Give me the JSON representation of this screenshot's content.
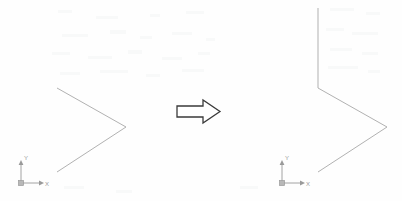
{
  "document": {
    "title": "CAD Line Drawing Exercise",
    "background_color": "#fefefe",
    "line_color": "#a8a8a8",
    "arrow_color": "#3a3a3a",
    "ucs_color": "#9a9a9a",
    "width": 402,
    "height": 201
  },
  "figures": [
    {
      "id": "before",
      "name": "Before - open chevron",
      "caption": "",
      "polyline": [
        {
          "x": 57,
          "y": 88
        },
        {
          "x": 126,
          "y": 127
        },
        {
          "x": 57,
          "y": 172
        }
      ],
      "ucs_icon": {
        "origin": {
          "x": 21,
          "y": 183
        },
        "x_label": "X",
        "y_label": "Y",
        "x_tip": {
          "x": 42,
          "y": 183
        },
        "y_tip": {
          "x": 21,
          "y": 162
        }
      }
    },
    {
      "id": "after",
      "name": "After - chevron with vertical extension",
      "caption": "",
      "polyline": [
        {
          "x": 318,
          "y": 8
        },
        {
          "x": 318,
          "y": 88
        },
        {
          "x": 387,
          "y": 127
        },
        {
          "x": 318,
          "y": 172
        }
      ],
      "ucs_icon": {
        "origin": {
          "x": 282,
          "y": 183
        },
        "x_label": "X",
        "y_label": "Y",
        "x_tip": {
          "x": 303,
          "y": 183
        },
        "y_tip": {
          "x": 282,
          "y": 162
        }
      }
    }
  ],
  "transform_arrow": {
    "name": "right-arrow",
    "direction": "right",
    "bounds": {
      "x": 177,
      "y": 100,
      "width": 43,
      "height": 23
    },
    "stroke": "#3a3a3a",
    "fill": "#ffffff"
  }
}
